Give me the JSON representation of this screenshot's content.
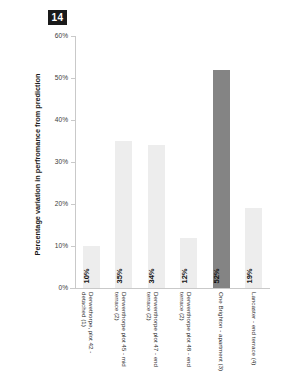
{
  "figure": {
    "number_badge": "14",
    "background_color": "#ffffff"
  },
  "chart_data": {
    "type": "bar",
    "title": "",
    "xlabel": "",
    "ylabel": "Percentage variation in perfromance from prediction",
    "ylim": [
      0,
      60
    ],
    "y_unit": "%",
    "grid": false,
    "legend": null,
    "y_ticks": [
      "0%",
      "10%",
      "20%",
      "30%",
      "40%",
      "50%",
      "60%"
    ],
    "y_tick_values": [
      0,
      10,
      20,
      30,
      40,
      50,
      60
    ],
    "categories": [
      "Derwethorpe, plot 42 - detached (1)",
      "Derwenthorpe plot 45 - mid terrace (2)",
      "Derwenthorpe plot 47 - end terrace (2)",
      "Derwenthorpe plot 48 - end terrace (2)",
      "One Brighton - apartment (3)",
      "Lancaster - end terrace (4)"
    ],
    "values": [
      10,
      35,
      34,
      12,
      52,
      19
    ],
    "value_labels": [
      "10%",
      "35%",
      "34%",
      "12%",
      "52%",
      "19%"
    ],
    "bar_colors": [
      "#ededed",
      "#ededed",
      "#ededed",
      "#ededed",
      "#848484",
      "#ededed"
    ],
    "highlighted_index": 4,
    "axis_color": "#c9c9c9",
    "label_color": "#2b2b2b"
  }
}
